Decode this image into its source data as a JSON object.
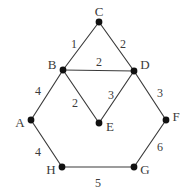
{
  "figure": {
    "type": "weighted-undirected-graph",
    "background_color": "#ffffff",
    "edge_color": "#3a3a3a",
    "node_color": "#111111",
    "text_color": "#3b3b3b"
  },
  "nodes": [
    {
      "id": "A",
      "label": "A",
      "x": 31,
      "y": 120,
      "label_x": 20,
      "label_y": 124
    },
    {
      "id": "B",
      "label": "B",
      "x": 63,
      "y": 70,
      "label_x": 52,
      "label_y": 66
    },
    {
      "id": "C",
      "label": "C",
      "x": 99,
      "y": 22,
      "label_x": 99,
      "label_y": 13
    },
    {
      "id": "D",
      "label": "D",
      "x": 134,
      "y": 71,
      "label_x": 145,
      "label_y": 66
    },
    {
      "id": "E",
      "label": "E",
      "x": 99,
      "y": 123,
      "label_x": 110,
      "label_y": 128
    },
    {
      "id": "F",
      "label": "F",
      "x": 166,
      "y": 120,
      "label_x": 176,
      "label_y": 118
    },
    {
      "id": "G",
      "label": "G",
      "x": 134,
      "y": 167,
      "label_x": 145,
      "label_y": 171
    },
    {
      "id": "H",
      "label": "H",
      "x": 62,
      "y": 167,
      "label_x": 51,
      "label_y": 171
    }
  ],
  "edges": [
    {
      "id": "BC",
      "from": "B",
      "to": "C",
      "weight": "1",
      "label_x": 74,
      "label_y": 45
    },
    {
      "id": "CD",
      "from": "C",
      "to": "D",
      "weight": "2",
      "label_x": 123,
      "label_y": 45
    },
    {
      "id": "BD",
      "from": "B",
      "to": "D",
      "weight": "2",
      "label_x": 99,
      "label_y": 63
    },
    {
      "id": "AB",
      "from": "A",
      "to": "B",
      "weight": "4",
      "label_x": 38,
      "label_y": 92
    },
    {
      "id": "BE",
      "from": "B",
      "to": "E",
      "weight": "2",
      "label_x": 75,
      "label_y": 104
    },
    {
      "id": "DE",
      "from": "D",
      "to": "E",
      "weight": "3",
      "label_x": 111,
      "label_y": 96
    },
    {
      "id": "DF",
      "from": "D",
      "to": "F",
      "weight": "3",
      "label_x": 160,
      "label_y": 94
    },
    {
      "id": "AH",
      "from": "A",
      "to": "H",
      "weight": "4",
      "label_x": 38,
      "label_y": 153
    },
    {
      "id": "FG",
      "from": "F",
      "to": "G",
      "weight": "6",
      "label_x": 160,
      "label_y": 148
    },
    {
      "id": "HG",
      "from": "H",
      "to": "G",
      "weight": "5",
      "label_x": 98,
      "label_y": 184
    }
  ],
  "graph_data": {
    "type": "graph",
    "directed": false,
    "weighted": true,
    "vertex_count": 8,
    "edge_count": 10,
    "vertices": [
      "A",
      "B",
      "C",
      "D",
      "E",
      "F",
      "G",
      "H"
    ],
    "edge_list": [
      [
        "B",
        "C",
        1
      ],
      [
        "C",
        "D",
        2
      ],
      [
        "B",
        "D",
        2
      ],
      [
        "A",
        "B",
        4
      ],
      [
        "B",
        "E",
        2
      ],
      [
        "D",
        "E",
        3
      ],
      [
        "D",
        "F",
        3
      ],
      [
        "A",
        "H",
        4
      ],
      [
        "F",
        "G",
        6
      ],
      [
        "H",
        "G",
        5
      ]
    ]
  }
}
